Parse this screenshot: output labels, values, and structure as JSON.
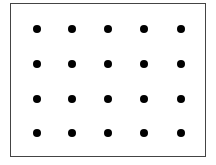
{
  "diagram": {
    "type": "dot-grid",
    "frame": {
      "border_color": "#444444",
      "background": "#ffffff"
    },
    "grid": {
      "columns": 5,
      "rows": 4,
      "dot_color": "#000000",
      "dot_diameter_px": 8,
      "x_positions": [
        37,
        72,
        108,
        144,
        181
      ],
      "y_positions": [
        29,
        64,
        99,
        133
      ]
    },
    "dot_count": 20
  }
}
